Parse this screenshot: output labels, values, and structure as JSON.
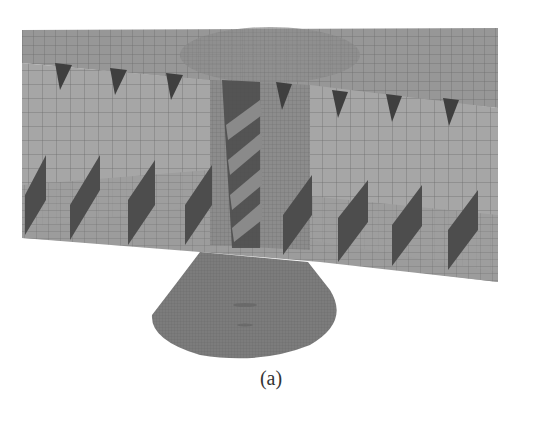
{
  "figure": {
    "caption": "(a)",
    "colors": {
      "background": "#ffffff",
      "plate": "#9a9a9a",
      "web": "#a8a8a8",
      "stiffener": "#555555",
      "mesh_line": "#6f6f6f",
      "cone": "#7a7a7a",
      "caption": "#333333"
    },
    "parts": [
      "top-deck-plate",
      "longitudinal-web-panels",
      "triangular-brackets",
      "bottom-flange-plate",
      "vertical-stiffeners",
      "central-column",
      "conical-base"
    ]
  }
}
